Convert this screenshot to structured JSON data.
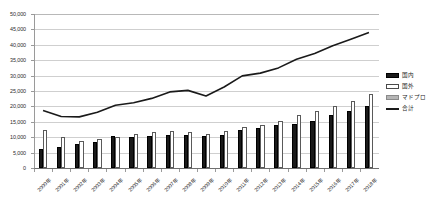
{
  "chart_data": {
    "type": "bar",
    "title": "",
    "subtitle": "",
    "xlabel": "",
    "ylabel": "",
    "ylim": [
      0,
      50000
    ],
    "ytick_step": 5000,
    "ytick_labels": [
      "0",
      "5,000",
      "10,000",
      "15,000",
      "20,000",
      "25,000",
      "30,000",
      "35,000",
      "40,000",
      "45,000",
      "50,000"
    ],
    "grid": true,
    "legend_position": "right",
    "categories": [
      "2000年",
      "2001年",
      "2002年",
      "2003年",
      "2004年",
      "2005年",
      "2006年",
      "2007年",
      "2008年",
      "2009年",
      "2010年",
      "2011年",
      "2012年",
      "2013年",
      "2014年",
      "2015年",
      "2016年",
      "2017年",
      "2018年"
    ],
    "series": [
      {
        "name": "国内",
        "kind": "bar",
        "color": "#1a1a1a",
        "values": [
          6300,
          6700,
          7800,
          8300,
          10300,
          10200,
          10400,
          10600,
          10600,
          10300,
          10600,
          12200,
          12900,
          14100,
          14200,
          15400,
          17200,
          18500,
          20000
        ]
      },
      {
        "name": "国外",
        "kind": "bar",
        "color": "#ffffff",
        "values": [
          12400,
          10000,
          8800,
          9300,
          10100,
          11000,
          11600,
          12100,
          11800,
          11000,
          12100,
          13200,
          13900,
          15400,
          17100,
          18600,
          20100,
          21900,
          24000
        ]
      },
      {
        "name": "マドプロ",
        "kind": "bar",
        "color": "#b5b5b5",
        "values": [
          0,
          0,
          0,
          0,
          0,
          0,
          0,
          0,
          0,
          0,
          0,
          0,
          0,
          0,
          0,
          0,
          0,
          0,
          0
        ]
      },
      {
        "name": "合計",
        "kind": "line",
        "color": "#1a1a1a",
        "values": [
          18700,
          16700,
          16600,
          18100,
          20400,
          21200,
          22600,
          24700,
          25200,
          23400,
          26300,
          29900,
          30800,
          32500,
          35300,
          37200,
          39700,
          41800,
          44000
        ]
      }
    ]
  },
  "legend": {
    "items": [
      {
        "label": "国内",
        "swatch": "bar-black"
      },
      {
        "label": "国外",
        "swatch": "bar-white"
      },
      {
        "label": "マドプロ",
        "swatch": "bar-gray"
      },
      {
        "label": "合計",
        "swatch": "line-black"
      }
    ]
  }
}
